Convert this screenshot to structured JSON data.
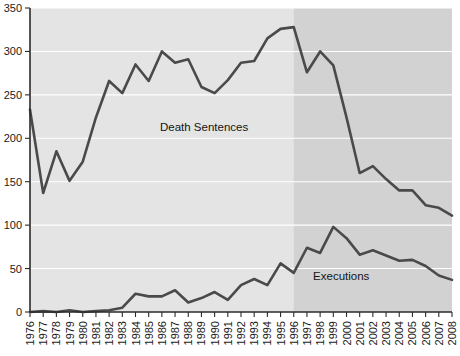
{
  "chart_data": {
    "type": "line",
    "title": "",
    "xlabel": "",
    "ylabel": "",
    "ylim": [
      0,
      350
    ],
    "ytick_step": 50,
    "yticks": [
      0,
      50,
      100,
      150,
      200,
      250,
      300,
      350
    ],
    "grid": true,
    "legend_position": "inline-annotation",
    "x": [
      1976,
      1977,
      1978,
      1979,
      1980,
      1981,
      1982,
      1983,
      1984,
      1985,
      1986,
      1987,
      1988,
      1989,
      1990,
      1991,
      1992,
      1993,
      1994,
      1995,
      1996,
      1997,
      1998,
      1999,
      2000,
      2001,
      2002,
      2003,
      2004,
      2005,
      2006,
      2007,
      2008
    ],
    "categories": [
      "1976",
      "1977",
      "1978",
      "1979",
      "1980",
      "1981",
      "1982",
      "1983",
      "1984",
      "1985",
      "1986",
      "1987",
      "1988",
      "1989",
      "1990",
      "1991",
      "1992",
      "1993",
      "1994",
      "1995",
      "1996",
      "1997",
      "1998",
      "1999",
      "2000",
      "2001",
      "2002",
      "2003",
      "2004",
      "2005",
      "2006",
      "2007",
      "2008"
    ],
    "series": [
      {
        "name": "Death Sentences",
        "label": "Death Sentences",
        "color": "#4a4a4a",
        "values": [
          233,
          137,
          185,
          151,
          173,
          224,
          266,
          252,
          285,
          266,
          300,
          287,
          291,
          259,
          252,
          267,
          287,
          289,
          315,
          326,
          328,
          276,
          300,
          284,
          224,
          160,
          168,
          153,
          140,
          140,
          123,
          120,
          111
        ]
      },
      {
        "name": "Executions",
        "label": "Executions",
        "color": "#4a4a4a",
        "values": [
          0,
          1,
          0,
          2,
          0,
          1,
          2,
          5,
          21,
          18,
          18,
          25,
          11,
          16,
          23,
          14,
          31,
          38,
          31,
          56,
          45,
          74,
          68,
          98,
          85,
          66,
          71,
          65,
          59,
          60,
          53,
          42,
          37
        ]
      }
    ],
    "annotations": [
      {
        "name": "death-sentences-label",
        "text": "Death Sentences",
        "x_value": 1989.2,
        "y_value": 208
      },
      {
        "name": "executions-label",
        "text": "Executions",
        "x_value": 1999.6,
        "y_value": 37
      }
    ],
    "shaded_region": {
      "name": "post-1996-shading",
      "from_x": 1996,
      "to_x": 2008,
      "color": "#d2d2d2"
    },
    "plot_background": "#e4e4e4"
  }
}
